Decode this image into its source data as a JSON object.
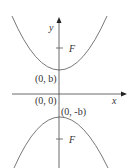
{
  "diagram": {
    "type": "two-parabolas-on-axes",
    "axes": {
      "x_label": "x",
      "y_label": "y",
      "origin_label": "(0, 0)"
    },
    "upper_parabola": {
      "vertex_label": "(0, b)",
      "focus_label": "F",
      "opens": "up"
    },
    "lower_parabola": {
      "vertex_label": "(0, -b)",
      "focus_label": "F",
      "opens": "down"
    },
    "colors": {
      "stroke": "#555555",
      "text": "#333333",
      "background": "#ffffff"
    }
  }
}
